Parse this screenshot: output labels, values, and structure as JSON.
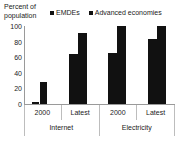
{
  "axis_title": "Percent of population",
  "legend": {
    "position": "top",
    "entries": [
      {
        "label": "EMDEs",
        "color": "#111111",
        "marker": "square-marker"
      },
      {
        "label": "Advanced economies",
        "color": "#111111",
        "marker": "square-marker"
      }
    ]
  },
  "y_ticks": [
    "100",
    "80",
    "60",
    "40",
    "20",
    "0"
  ],
  "x_labels": [
    "2000",
    "Latest",
    "2000",
    "Latest"
  ],
  "group_labels": [
    "Internet",
    "Electricity"
  ],
  "chart_data": {
    "type": "bar",
    "title": "",
    "subtitle": "",
    "xlabel": "",
    "ylabel": "Percent of population",
    "ylim": [
      0,
      100
    ],
    "yticks": [
      0,
      20,
      40,
      60,
      80,
      100
    ],
    "grid": false,
    "legend_position": "top",
    "categories": [
      "Internet 2000",
      "Internet Latest",
      "Electricity 2000",
      "Electricity Latest"
    ],
    "groups": [
      {
        "name": "Internet",
        "categories": [
          "2000",
          "Latest"
        ]
      },
      {
        "name": "Electricity",
        "categories": [
          "2000",
          "Latest"
        ]
      }
    ],
    "series": [
      {
        "name": "EMDEs",
        "color": "#111111",
        "values": [
          2,
          64,
          66,
          83
        ]
      },
      {
        "name": "Advanced economies",
        "color": "#111111",
        "values": [
          28,
          91,
          100,
          100
        ]
      }
    ]
  }
}
